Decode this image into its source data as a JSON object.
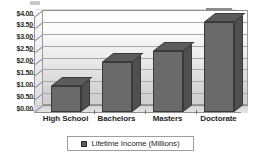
{
  "chart_data": {
    "type": "bar",
    "title": "",
    "subtitle": "",
    "xlabel": "",
    "ylabel": "",
    "categories": [
      "High School",
      "Bachelors",
      "Masters",
      "Doctorate"
    ],
    "series": [
      {
        "name": "Lifetime Income (Millions)",
        "values": [
          1.1,
          2.1,
          2.55,
          3.8
        ]
      }
    ],
    "ylim": [
      0,
      4.0
    ],
    "ytick_step": 0.5,
    "ytick_labels": [
      "$0.00",
      "$0.50",
      "$1.00",
      "$1.50",
      "$2.00",
      "$2.50",
      "$3.00",
      "$3.50",
      "$4.00"
    ],
    "ytick_values": [
      0,
      0.5,
      1.0,
      1.5,
      2.0,
      2.5,
      3.0,
      3.5,
      4.0
    ],
    "grid": true,
    "grid_orientation": "horizontal",
    "legend": {
      "position": "bottom",
      "entries": [
        {
          "label": "Lifetime Income (Millions)",
          "swatch": "#5a5a5a"
        }
      ]
    },
    "style": {
      "three_d": true,
      "bar_face_color": "#6a6a6a",
      "bar_side_color": "#4f4f4f",
      "bar_top_color": "#5c5c5c",
      "bar_edge_color": "#3a3a3a",
      "plot_border_color": "#9a9a9a",
      "gridline_color": "#8d8d8d",
      "background": "#ffffff"
    }
  }
}
